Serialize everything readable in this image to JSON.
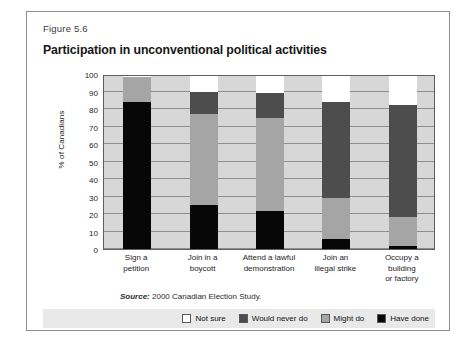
{
  "figure": {
    "number": "Figure 5.6",
    "title": "Participation in unconventional political activities",
    "source": "Source: 2000 Canadian Election Study.",
    "source_prefix": "Source:",
    "source_rest": " 2000 Canadian Election Study."
  },
  "colors": {
    "have_done": "#070707",
    "might_do": "#a5a5a5",
    "would_never_do": "#4d4d4d",
    "not_sure": "#ffffff",
    "plot_background": "#d7d7d7",
    "gridline": "#8e8e8e",
    "legend_background": "#e9e9e9",
    "frame": "#8d8d8d"
  },
  "legend": {
    "items": [
      {
        "label": "Not sure",
        "color": "#ffffff",
        "key": "not_sure"
      },
      {
        "label": "Would never do",
        "color": "#4d4d4d",
        "key": "would_never_do"
      },
      {
        "label": "Might do",
        "color": "#a5a5a5",
        "key": "might_do"
      },
      {
        "label": "Have done",
        "color": "#070707",
        "key": "have_done"
      }
    ]
  },
  "chart_data": {
    "type": "bar",
    "stacked": true,
    "title": "Participation in unconventional political activities",
    "subtitle": "Figure 5.6",
    "xlabel": "",
    "ylabel": "% of Canadians",
    "ylim": [
      0,
      100
    ],
    "yticks": [
      0,
      10,
      20,
      30,
      40,
      50,
      60,
      70,
      80,
      90,
      100
    ],
    "ytick_labels": [
      "0",
      "10",
      "20",
      "30",
      "40",
      "50",
      "60",
      "70",
      "80",
      "90",
      "100"
    ],
    "grid": true,
    "legend_position": "bottom-right",
    "categories": [
      "Sign a petition",
      "Join in a boycott",
      "Attend a lawful demonstration",
      "Join an illegal strike",
      "Occupy a building or factory"
    ],
    "category_lines": [
      [
        "Sign a",
        "petition"
      ],
      [
        "Join in a",
        "boycott"
      ],
      [
        "Attend a lawful",
        "demonstration"
      ],
      [
        "Join an",
        "illegal strike"
      ],
      [
        "Occupy a",
        "building",
        "or factory"
      ]
    ],
    "series": [
      {
        "name": "Have done",
        "color": "#070707",
        "values": [
          84,
          25,
          22,
          6,
          2
        ]
      },
      {
        "name": "Might do",
        "color": "#a5a5a5",
        "values": [
          14.5,
          52,
          53,
          23,
          16.5
        ]
      },
      {
        "name": "Would never do",
        "color": "#4d4d4d",
        "values": [
          0,
          13,
          14,
          55,
          64
        ]
      },
      {
        "name": "Not sure",
        "color": "#ffffff",
        "values": [
          1.5,
          10,
          11,
          16,
          17.5
        ]
      }
    ],
    "cumulative_tops": [
      [
        84,
        98.5,
        98.5,
        100
      ],
      [
        25,
        77,
        90,
        100
      ],
      [
        22,
        75,
        89,
        100
      ],
      [
        6,
        29,
        84,
        100
      ],
      [
        2,
        18.5,
        82.5,
        100
      ]
    ],
    "annotations": [
      "Source: 2000 Canadian Election Study."
    ]
  }
}
